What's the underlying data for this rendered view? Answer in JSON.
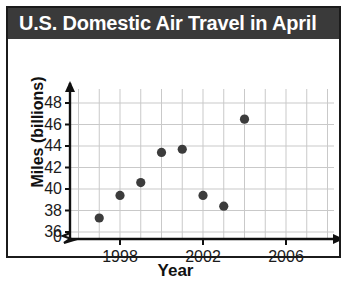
{
  "figure": {
    "title": "U.S. Domestic Air Travel in April",
    "title_bar_color": "#3a3a3a",
    "border_color": "#1b1b1b",
    "background_color": "#ffffff"
  },
  "chart_data": {
    "type": "scatter",
    "title": "U.S. Domestic Air Travel in April",
    "xlabel": "Year",
    "ylabel": "Miles (billions)",
    "x": [
      1997,
      1998,
      1999,
      2000,
      2001,
      2002,
      2003,
      2004
    ],
    "values": [
      37.3,
      39.4,
      40.6,
      43.4,
      43.7,
      39.4,
      38.4,
      46.5
    ],
    "xlim": [
      1996,
      2008
    ],
    "ylim": [
      35,
      49
    ],
    "y_axis_break": true,
    "y_origin_label": "0",
    "ytick_labels": [
      "36",
      "38",
      "40",
      "42",
      "44",
      "46",
      "48"
    ],
    "yticks": [
      36,
      38,
      40,
      42,
      44,
      46,
      48
    ],
    "xtick_labels": [
      "1998",
      "2002",
      "2006"
    ],
    "xticks": [
      1998,
      2002,
      2006
    ],
    "x_minor_step": 1,
    "grid": true,
    "grid_color": "#c9c9c9",
    "marker_color": "#3c3c3c",
    "legend": null
  },
  "axis_marks": {
    "origin_label": "0",
    "break_symbol": "axis-break"
  }
}
